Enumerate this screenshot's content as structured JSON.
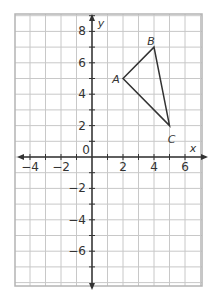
{
  "chart_data": {
    "type": "scatter",
    "title": "",
    "xlabel": "x",
    "ylabel": "y",
    "xlim": [
      -5,
      7
    ],
    "ylim": [
      -8,
      9
    ],
    "grid": true,
    "x_ticks": [
      -4,
      -2,
      0,
      2,
      4,
      6
    ],
    "y_ticks": [
      8,
      6,
      4,
      2,
      -2,
      -4,
      -6
    ],
    "x_tick_labels": [
      "−4",
      "−2",
      "0",
      "2",
      "4",
      "6"
    ],
    "y_tick_labels": [
      "8",
      "6",
      "4",
      "2",
      "−2",
      "−4",
      "−6"
    ],
    "shapes": [
      {
        "type": "triangle",
        "vertices": [
          {
            "label": "A",
            "x": 2,
            "y": 5
          },
          {
            "label": "B",
            "x": 4,
            "y": 7
          },
          {
            "label": "C",
            "x": 5,
            "y": 2
          }
        ]
      }
    ]
  },
  "colors": {
    "grid": "#c8c8c8",
    "border": "#b4b4b4",
    "axis": "#333333",
    "shape": "#333333",
    "background": "#ffffff"
  }
}
